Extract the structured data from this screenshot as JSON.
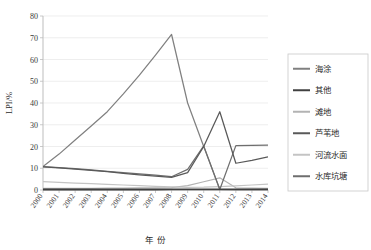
{
  "chart_data": {
    "type": "line",
    "title": "",
    "xlabel": "年 份",
    "ylabel": "LPI/%",
    "x": [
      2000,
      2001,
      2002,
      2003,
      2004,
      2005,
      2006,
      2007,
      2008,
      2009,
      2010,
      2011,
      2012,
      2013,
      2014
    ],
    "xtick_labels": [
      "2000",
      "2001",
      "2002",
      "2003",
      "2004",
      "2005",
      "2006",
      "2007",
      "2008",
      "2009",
      "2010",
      "2011",
      "2012",
      "2013",
      "2014"
    ],
    "ytick_labels": [
      "0",
      "10",
      "20",
      "30",
      "40",
      "50",
      "60",
      "70",
      "80"
    ],
    "ylim": [
      0,
      80
    ],
    "ytick_step": 10,
    "grid": "horizontal",
    "legend_position": "right",
    "series": [
      {
        "name": "海涂",
        "color": "#808080",
        "values": [
          10.8,
          16.5,
          23.0,
          29.4,
          36.0,
          44.2,
          52.8,
          62.0,
          71.5,
          40.0,
          20.0,
          0.3,
          0.2,
          0.2,
          0.2
        ]
      },
      {
        "name": "其他",
        "color": "#404040",
        "values": [
          0.2,
          0.2,
          0.2,
          0.2,
          0.2,
          0.2,
          0.2,
          0.2,
          0.3,
          0.3,
          0.3,
          0.3,
          0.3,
          0.3,
          0.3
        ]
      },
      {
        "name": "滩地",
        "color": "#b3b3b3",
        "values": [
          0.8,
          0.8,
          0.8,
          0.8,
          0.9,
          0.9,
          1.0,
          1.0,
          1.1,
          2.0,
          3.8,
          5.6,
          1.0,
          0.9,
          0.8
        ]
      },
      {
        "name": "芦苇地",
        "color": "#595959",
        "values": [
          10.6,
          10.2,
          9.6,
          9.0,
          8.4,
          7.6,
          7.0,
          6.4,
          5.8,
          8.0,
          20.0,
          36.0,
          12.3,
          13.6,
          15.2
        ]
      },
      {
        "name": "河流水面",
        "color": "#c4c4c4",
        "values": [
          3.8,
          3.5,
          3.2,
          2.9,
          2.6,
          2.3,
          2.0,
          1.7,
          1.4,
          1.2,
          1.3,
          1.6,
          1.9,
          2.3,
          2.7
        ]
      },
      {
        "name": "水库坑塘",
        "color": "#6e6e6e",
        "values": [
          10.7,
          10.3,
          9.8,
          9.3,
          8.6,
          8.0,
          7.4,
          6.8,
          6.1,
          9.5,
          20.3,
          0.2,
          20.4,
          20.5,
          20.6
        ]
      }
    ]
  },
  "legend": {
    "entries": [
      {
        "label": "海涂"
      },
      {
        "label": "其他"
      },
      {
        "label": "滩地"
      },
      {
        "label": "芦苇地"
      },
      {
        "label": "河流水面"
      },
      {
        "label": "水库坑塘"
      }
    ]
  }
}
